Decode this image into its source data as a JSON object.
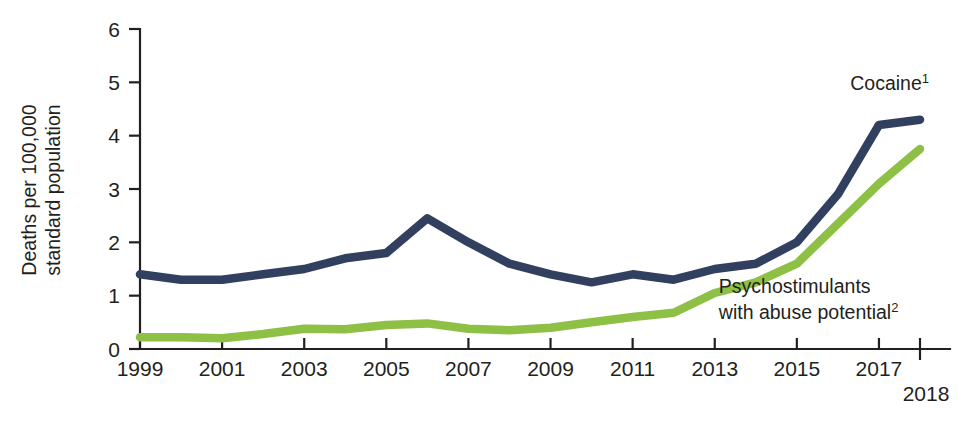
{
  "chart_data": {
    "type": "line",
    "title": "",
    "xlabel": "",
    "ylabel": "Deaths per 100,000 standard population",
    "ylabel_line1": "Deaths per 100,000",
    "ylabel_line2": "standard population",
    "xlim": [
      1999,
      2018
    ],
    "ylim": [
      0,
      6
    ],
    "grid": false,
    "legend_position": "inline-annotation",
    "y_ticks": [
      "0",
      "1",
      "2",
      "3",
      "4",
      "5",
      "6"
    ],
    "y_tick_values": [
      0,
      1,
      2,
      3,
      4,
      5,
      6
    ],
    "x_ticks": [
      "1999",
      "2001",
      "2003",
      "2005",
      "2007",
      "2009",
      "2011",
      "2013",
      "2015",
      "2017"
    ],
    "x_tick_values": [
      1999,
      2001,
      2003,
      2005,
      2007,
      2009,
      2011,
      2013,
      2015,
      2017
    ],
    "x_final_tick": "2018",
    "x_final_tick_value": 2018,
    "x": [
      1999,
      2000,
      2001,
      2002,
      2003,
      2004,
      2005,
      2006,
      2007,
      2008,
      2009,
      2010,
      2011,
      2012,
      2013,
      2014,
      2015,
      2016,
      2017,
      2018
    ],
    "series": [
      {
        "name": "Cocaine",
        "footnote": "1",
        "color": "#32405f",
        "values": [
          1.4,
          1.3,
          1.3,
          1.4,
          1.5,
          1.7,
          1.8,
          2.45,
          2.0,
          1.6,
          1.4,
          1.25,
          1.4,
          1.3,
          1.5,
          1.6,
          2.0,
          2.9,
          4.2,
          4.3
        ],
        "label_x": 2016.3,
        "label_y": 4.85
      },
      {
        "name": "Psychostimulants with abuse potential",
        "name_line1": "Psychostimulants",
        "name_line2": "with abuse potential",
        "footnote": "2",
        "color": "#8dc044",
        "values": [
          0.22,
          0.22,
          0.2,
          0.28,
          0.38,
          0.37,
          0.45,
          0.48,
          0.38,
          0.35,
          0.4,
          0.5,
          0.6,
          0.68,
          1.05,
          1.25,
          1.6,
          2.35,
          3.1,
          3.75
        ],
        "label_x": 2013.1,
        "label_y": 1.05
      }
    ]
  },
  "figure": {
    "background_color": "#ffffff",
    "axis_color": "#231f20"
  }
}
